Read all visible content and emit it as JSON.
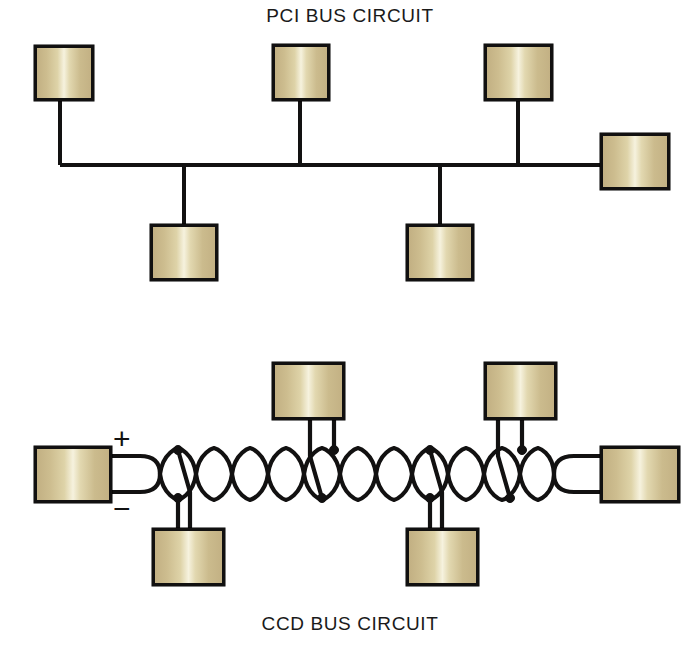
{
  "titles": {
    "top": "PCI BUS CIRCUIT",
    "bottom": "CCD BUS CIRCUIT"
  },
  "colors": {
    "box_fill_edge": "#c2b083",
    "box_fill_highlight": "#f6f2de",
    "line": "#121111",
    "background": "#ffffff",
    "text": "#1a1a1a"
  },
  "pci_circuit": {
    "name": "PCI BUS CIRCUIT",
    "topology": "linear shared bus with stub drops",
    "bus": {
      "y": 165,
      "x_start": 60,
      "x_end": 600
    },
    "nodes_top": [
      {
        "id": "pci-node-1",
        "x": 34,
        "y": 45,
        "w": 60,
        "h": 56,
        "stub_x": 60
      },
      {
        "id": "pci-node-2",
        "x": 272,
        "y": 44,
        "w": 58,
        "h": 57,
        "stub_x": 300
      },
      {
        "id": "pci-node-3",
        "x": 484,
        "y": 44,
        "w": 69,
        "h": 57,
        "stub_x": 518
      }
    ],
    "nodes_bottom": [
      {
        "id": "pci-node-4",
        "x": 150,
        "y": 224,
        "w": 68,
        "h": 57,
        "stub_x": 184
      },
      {
        "id": "pci-node-5",
        "x": 406,
        "y": 224,
        "w": 68,
        "h": 57,
        "stub_x": 440
      }
    ],
    "nodes_right": [
      {
        "id": "pci-node-6",
        "x": 600,
        "y": 133,
        "w": 70,
        "h": 57
      }
    ]
  },
  "ccd_circuit": {
    "name": "CCD BUS CIRCUIT",
    "topology": "twisted-pair differential bus with tapped drops",
    "polarity_labels": {
      "plus": "+",
      "minus": "−"
    },
    "twisted_pair": {
      "axis_y": 474,
      "x_start": 142,
      "x_end": 600,
      "amplitude": 26,
      "loop_width": 36,
      "loops": 13
    },
    "terminator_left": {
      "id": "ccd-node-left",
      "x": 34,
      "y": 446,
      "w": 78,
      "h": 57
    },
    "terminator_right": {
      "id": "ccd-node-right",
      "x": 600,
      "y": 446,
      "w": 80,
      "h": 57
    },
    "nodes_top": [
      {
        "id": "ccd-node-top-1",
        "x": 272,
        "y": 362,
        "w": 73,
        "h": 58,
        "tap_x": 322
      },
      {
        "id": "ccd-node-top-2",
        "x": 484,
        "y": 362,
        "w": 73,
        "h": 58,
        "tap_x": 538
      }
    ],
    "nodes_bottom": [
      {
        "id": "ccd-node-bottom-1",
        "x": 152,
        "y": 528,
        "w": 73,
        "h": 58,
        "tap_x": 196
      },
      {
        "id": "ccd-node-bottom-2",
        "x": 406,
        "y": 528,
        "w": 73,
        "h": 58,
        "tap_x": 450
      }
    ],
    "tap_nodes_count": 8
  }
}
